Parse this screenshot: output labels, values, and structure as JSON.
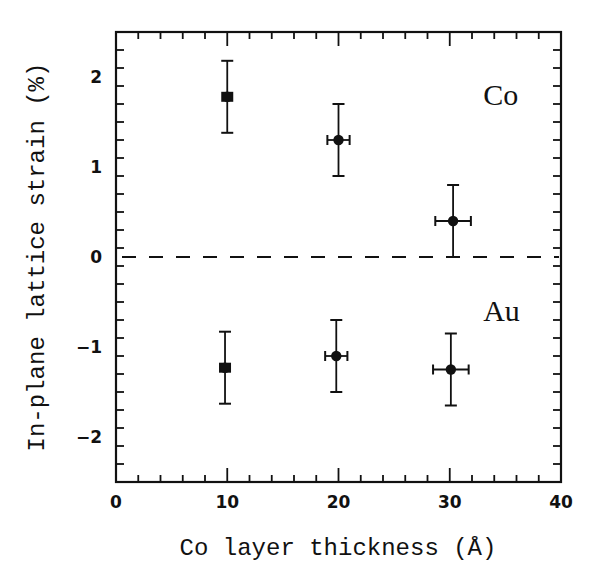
{
  "chart_data": {
    "type": "scatter",
    "title": "",
    "xlabel": "Co layer thickness  (Å)",
    "ylabel": "In-plane lattice strain (%)",
    "xlim": [
      0,
      40
    ],
    "ylim": [
      -2.5,
      2.5
    ],
    "x_major_ticks": [
      0,
      10,
      20,
      30,
      40
    ],
    "x_tick_labels": [
      "0",
      "10",
      "20",
      "30",
      "40"
    ],
    "x_minor_step": 2,
    "y_major_ticks": [
      2,
      1,
      0,
      -1,
      -2
    ],
    "y_tick_labels": [
      "2",
      "1",
      "0",
      "−1",
      "−2"
    ],
    "y_minor_step": 0.2,
    "grid": false,
    "legend": "none",
    "reference_line": {
      "y": 0,
      "style": "dashed"
    },
    "annotations": [
      {
        "text": "Co",
        "x": 33,
        "y": 1.8
      },
      {
        "text": "Au",
        "x": 33,
        "y": -0.6
      }
    ],
    "series": [
      {
        "name": "Co",
        "marker": "filled-circle",
        "points": [
          {
            "x": 10,
            "y": 1.78,
            "xerr": 0.3,
            "yerr": 0.4
          },
          {
            "x": 20,
            "y": 1.3,
            "xerr": 1.0,
            "yerr": 0.4
          },
          {
            "x": 30.3,
            "y": 0.4,
            "xerr": 1.6,
            "yerr": 0.4
          }
        ]
      },
      {
        "name": "Au",
        "marker": "filled-circle",
        "points": [
          {
            "x": 9.8,
            "y": -1.23,
            "xerr": 0.3,
            "yerr": 0.4
          },
          {
            "x": 19.8,
            "y": -1.1,
            "xerr": 1.0,
            "yerr": 0.4
          },
          {
            "x": 30.1,
            "y": -1.25,
            "xerr": 1.6,
            "yerr": 0.4
          }
        ]
      }
    ]
  },
  "colors": {
    "ink": "#111111",
    "background": "#ffffff"
  }
}
